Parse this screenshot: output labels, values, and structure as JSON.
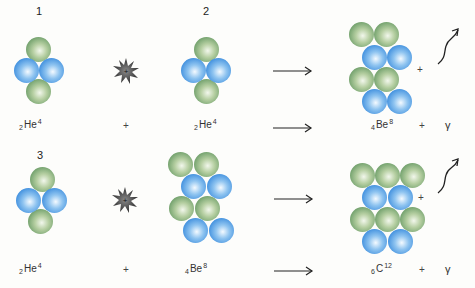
{
  "diagram": {
    "colors": {
      "neutron_green": "#6f9f6a",
      "proton_blue": "#3f8fde",
      "energy_star": "#444444",
      "text": "#333333"
    },
    "row1": {
      "step1_number": "1",
      "step2_number": "2",
      "reactant1": {
        "sub": "2",
        "symbol": "He",
        "sup": "4"
      },
      "plus1": "+",
      "reactant2": {
        "sub": "2",
        "symbol": "He",
        "sup": "4"
      },
      "product": {
        "sub": "4",
        "symbol": "Be",
        "sup": "8"
      },
      "plus2": "+",
      "plus_mid": "+",
      "gamma": "γ"
    },
    "row2": {
      "step3_number": "3",
      "reactant1": {
        "sub": "2",
        "symbol": "He",
        "sup": "4"
      },
      "plus1": "+",
      "reactant2": {
        "sub": "4",
        "symbol": "Be",
        "sup": "8"
      },
      "product": {
        "sub": "6",
        "symbol": "C",
        "sup": "12"
      },
      "plus2": "+",
      "plus_mid": "+",
      "gamma": "γ"
    }
  }
}
